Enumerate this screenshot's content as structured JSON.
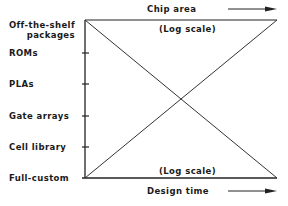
{
  "y_axis": {
    "categories": [
      {
        "line1": "Off-the-shelf",
        "line2": "packages"
      },
      {
        "line1": "ROMs"
      },
      {
        "line1": "PLAs"
      },
      {
        "line1": "Gate arrays"
      },
      {
        "line1": "Cell library"
      },
      {
        "line1": "Full-custom"
      }
    ]
  },
  "top_axis": {
    "title": "Chip area",
    "scale_note": "(Log scale)"
  },
  "bottom_axis": {
    "title": "Design time",
    "scale_note": "(Log scale)"
  },
  "lines": [
    {
      "name": "chip-area-line",
      "from": "Off-the-shelf packages: max",
      "to": "Full-custom: min"
    },
    {
      "name": "design-time-line",
      "from": "Full-custom: max",
      "to": "Off-the-shelf packages: min"
    }
  ]
}
